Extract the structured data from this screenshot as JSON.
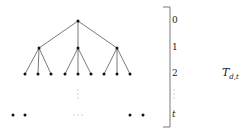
{
  "diagram": {
    "title": {
      "main": "T",
      "subscript": "d,t"
    },
    "levels": [
      {
        "label": "0",
        "y": 21
      },
      {
        "label": "1",
        "y": 48
      },
      {
        "label": "2",
        "y": 74
      },
      {
        "label": "⋮",
        "y": 95
      },
      {
        "label": "t",
        "y": 115
      }
    ],
    "tree": {
      "root": [
        78,
        21
      ],
      "level1": [
        [
          39,
          48
        ],
        [
          78,
          48
        ],
        [
          117,
          48
        ]
      ],
      "level2": [
        [
          25,
          74
        ],
        [
          38,
          74
        ],
        [
          51,
          74
        ],
        [
          65,
          74
        ],
        [
          78,
          74
        ],
        [
          91,
          74
        ],
        [
          104,
          74
        ],
        [
          117,
          74
        ],
        [
          130,
          74
        ]
      ],
      "levelt_left": [
        [
          13,
          115
        ],
        [
          25,
          115
        ]
      ],
      "levelt_right": [
        [
          130,
          115
        ],
        [
          143,
          115
        ]
      ],
      "vdots": "⋮",
      "hdots": "⋯"
    },
    "colors": {
      "line": "#555555",
      "node": "#111111"
    }
  }
}
